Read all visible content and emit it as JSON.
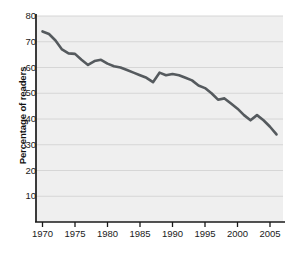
{
  "chart_data": {
    "type": "line",
    "title": "",
    "subtitle": "",
    "xlabel": "",
    "ylabel": "Percentage of readers",
    "xlim": [
      1969,
      2007
    ],
    "ylim": [
      0,
      80
    ],
    "xticks": [
      1970,
      1975,
      1980,
      1985,
      1990,
      1995,
      2000,
      2005
    ],
    "xtick_labels": [
      "1970",
      "1975",
      "1980",
      "1985",
      "1990",
      "1995",
      "2000",
      "2005"
    ],
    "yticks": [
      10,
      20,
      30,
      40,
      50,
      60,
      70,
      80
    ],
    "ytick_labels": [
      "10",
      "20",
      "30",
      "40",
      "50",
      "60",
      "70",
      "80"
    ],
    "grid": "horizontal",
    "legend": "none",
    "annotations": [],
    "series": [
      {
        "name": "Percentage of readers",
        "color": "#555a5e",
        "line_width": 2.6,
        "x": [
          1970,
          1971,
          1972,
          1973,
          1974,
          1975,
          1976,
          1977,
          1978,
          1979,
          1980,
          1981,
          1982,
          1983,
          1984,
          1985,
          1986,
          1987,
          1988,
          1989,
          1990,
          1991,
          1992,
          1993,
          1994,
          1995,
          1996,
          1997,
          1998,
          1999,
          2000,
          2001,
          2002,
          2003,
          2004,
          2005,
          2006
        ],
        "values": [
          74.0,
          73.0,
          70.5,
          67.0,
          65.5,
          65.3,
          63.0,
          61.0,
          62.5,
          63.0,
          61.5,
          60.5,
          60.0,
          59.0,
          58.0,
          57.0,
          56.0,
          54.3,
          58.0,
          57.0,
          57.5,
          57.0,
          56.0,
          55.0,
          53.0,
          52.0,
          50.0,
          47.5,
          48.0,
          46.0,
          44.0,
          41.5,
          39.5,
          41.5,
          39.5,
          37.0,
          34.0
        ]
      }
    ]
  },
  "axis": {
    "y_title": "Percentage of readers"
  },
  "plot": {
    "background_color": "#efefef",
    "gridline_color": "#d6d6d6",
    "axis_color": "#1a1a1a",
    "line_color": "#555a5e"
  }
}
